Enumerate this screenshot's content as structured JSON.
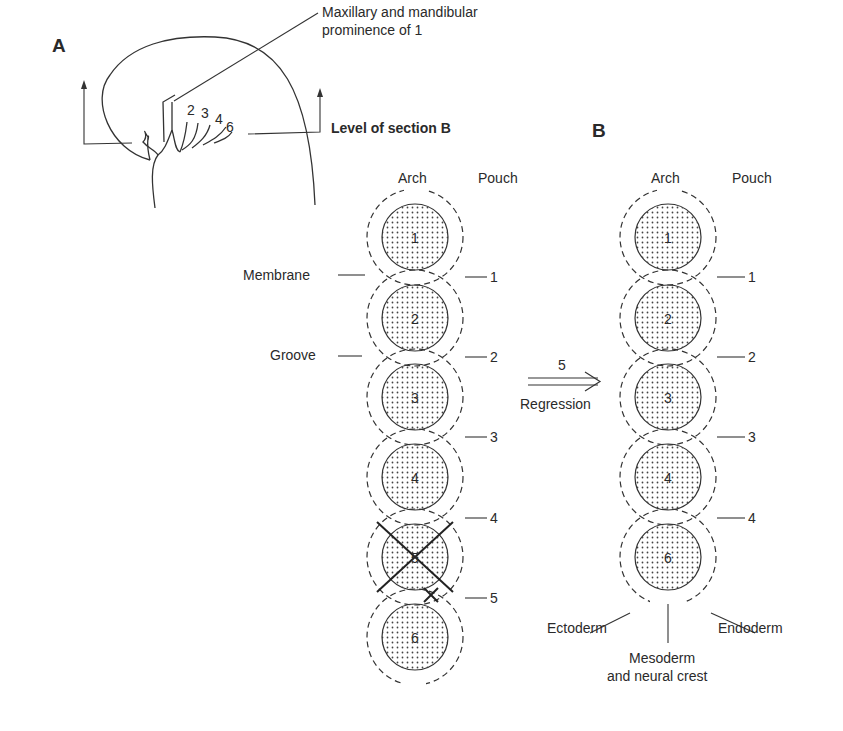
{
  "panel_a": {
    "label": "A",
    "callout": [
      "Maxillary and mandibular",
      "prominence of 1"
    ],
    "arch_numbers": [
      "2",
      "3",
      "4",
      "6"
    ],
    "section_label": "Level of section B"
  },
  "panel_b": {
    "label": "B"
  },
  "left_column": {
    "header_arch": "Arch",
    "header_pouch": "Pouch",
    "arches": [
      "1",
      "2",
      "3",
      "4",
      "5",
      "6"
    ],
    "pouches": [
      "1",
      "2",
      "3",
      "4",
      "5"
    ],
    "left_labels": {
      "membrane": "Membrane",
      "groove": "Groove"
    }
  },
  "transition": {
    "number": "5",
    "label": "Regression"
  },
  "right_column": {
    "header_arch": "Arch",
    "header_pouch": "Pouch",
    "arches": [
      "1",
      "2",
      "3",
      "4",
      "6"
    ],
    "pouches": [
      "1",
      "2",
      "3",
      "4"
    ],
    "layers": {
      "ectoderm": "Ectoderm",
      "endoderm": "Endoderm",
      "mesoderm": [
        "Mesoderm",
        "and neural crest"
      ]
    }
  }
}
